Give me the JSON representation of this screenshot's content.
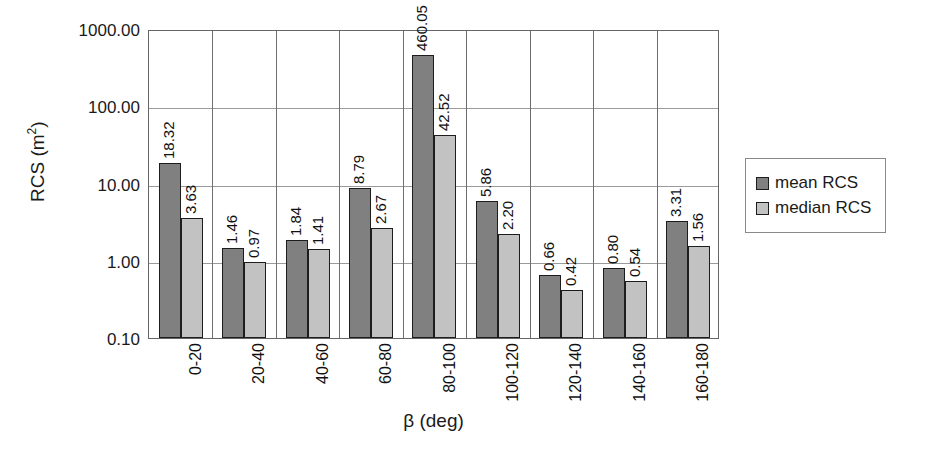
{
  "chart_data": {
    "type": "bar",
    "title": "",
    "xlabel": "β (deg)",
    "ylabel": "RCS (m²)",
    "ylabel_base": "RCS (m",
    "ylabel_sup": "2",
    "ylabel_close": ")",
    "yscale": "log",
    "ylim": [
      0.1,
      1000
    ],
    "ytick_labels": [
      "1000.00",
      "100.00",
      "10.00",
      "1.00",
      "0.10"
    ],
    "ytick_values": [
      1000,
      100,
      10,
      1,
      0.1
    ],
    "grid": true,
    "legend_position": "right",
    "categories": [
      "0-20",
      "20-40",
      "40-60",
      "60-80",
      "80-100",
      "100-120",
      "120-140",
      "140-160",
      "160-180"
    ],
    "series": [
      {
        "name": "mean RCS",
        "color": "#808080",
        "values": [
          18.32,
          1.46,
          1.84,
          8.79,
          460.05,
          5.86,
          0.66,
          0.8,
          3.31
        ],
        "labels": [
          "18.32",
          "1.46",
          "1.84",
          "8.79",
          "460.05",
          "5.86",
          "0.66",
          "0.80",
          "3.31"
        ]
      },
      {
        "name": "median RCS",
        "color": "#c2c2c2",
        "values": [
          3.63,
          0.97,
          1.41,
          2.67,
          42.52,
          2.2,
          0.42,
          0.54,
          1.56
        ],
        "labels": [
          "3.63",
          "0.97",
          "1.41",
          "2.67",
          "42.52",
          "2.20",
          "0.42",
          "0.54",
          "1.56"
        ]
      }
    ]
  },
  "legend": {
    "items": [
      {
        "label": "mean RCS",
        "swatch": "mean"
      },
      {
        "label": "median RCS",
        "swatch": "median"
      }
    ]
  }
}
